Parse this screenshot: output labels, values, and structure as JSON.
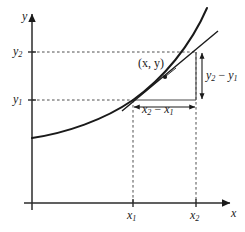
{
  "figure": {
    "type": "math-graph",
    "background_color": "#ffffff",
    "ink_color": "#1a1a1a",
    "axes": {
      "x_label": "x",
      "y_label": "y",
      "origin_px": {
        "x": 32,
        "y": 203
      },
      "x_axis_end_px": {
        "x": 232,
        "y": 203
      },
      "y_axis_end_px": {
        "x": 32,
        "y": 12
      },
      "arrowheads": true,
      "grid": false
    },
    "tick_labels": {
      "x1": {
        "text": "x",
        "sub": "1",
        "value_px": 133
      },
      "x2": {
        "text": "x",
        "sub": "2",
        "value_px": 196
      },
      "y1": {
        "text": "y",
        "sub": "1",
        "value_px": 100
      },
      "y2": {
        "text": "y",
        "sub": "2",
        "value_px": 52
      }
    },
    "annotations": {
      "point_label": {
        "text": "(x, y)",
        "x_px": 138,
        "y_px": 57
      },
      "rise_label": {
        "lead": "y",
        "lead_sub": "2",
        "operator": " − ",
        "trail": "y",
        "trail_sub": "1"
      },
      "run_label": {
        "lead": "x",
        "lead_sub": "2",
        "operator": " − ",
        "trail": "x",
        "trail_sub": "1"
      }
    },
    "dashed_guides": [
      {
        "name": "y2-guide",
        "from_px": [
          32,
          52
        ],
        "to_px": [
          196,
          52
        ]
      },
      {
        "name": "y1-guide",
        "from_px": [
          32,
          100
        ],
        "to_px": [
          133,
          100
        ]
      },
      {
        "name": "x1-guide",
        "from_px": [
          133,
          100
        ],
        "to_px": [
          133,
          203
        ]
      },
      {
        "name": "x2-guide",
        "from_px": [
          196,
          52
        ],
        "to_px": [
          196,
          203
        ]
      }
    ],
    "curve": {
      "name": "increasing-convex-curve",
      "stroke_width": 1.9,
      "path": "M 32 138 C 66 133 104 120 133 100 C 162 80 190 46 207 8"
    },
    "secant_line": {
      "name": "secant-line",
      "stroke_width": 1.4,
      "from_px": [
        122,
        110
      ],
      "to_px": [
        218,
        31
      ]
    },
    "triangle_legs": {
      "horizontal": {
        "from_px": [
          133,
          100
        ],
        "to_px": [
          196,
          100
        ]
      },
      "vertical": {
        "from_px": [
          196,
          52
        ],
        "to_px": [
          196,
          100
        ]
      }
    },
    "measure_arrows": {
      "rise": {
        "x_px": 202,
        "from_y_px": 52,
        "to_y_px": 100,
        "double_headed": true
      },
      "run": {
        "y_px": 107,
        "from_x_px": 133,
        "to_x_px": 196,
        "double_headed": true
      }
    }
  }
}
